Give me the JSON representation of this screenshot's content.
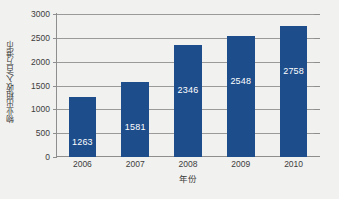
{
  "chart_data": {
    "type": "bar",
    "title": "",
    "subtitle": "",
    "categories": [
      "2006",
      "2007",
      "2008",
      "2009",
      "2010"
    ],
    "values": [
      1263,
      1581,
      2346,
      2548,
      2758
    ],
    "data_labels": [
      "1263",
      "1581",
      "2346",
      "2548",
      "2758"
    ],
    "xlabel": "年份",
    "ylabel": "物业出租收入/百万港币",
    "ylim": [
      0,
      3000
    ],
    "ytick_values": [
      0,
      500,
      1000,
      1500,
      2000,
      2500,
      3000
    ],
    "ytick_labels": [
      "0",
      "500",
      "1000",
      "1500",
      "2000",
      "2500",
      "3000"
    ],
    "grid": true,
    "grid_axis": "y",
    "legend": false,
    "legend_position": "none",
    "series": [
      {
        "name": "物业出租收入",
        "values": [
          1263,
          1581,
          2346,
          2548,
          2758
        ],
        "color": "#1e4d8b"
      }
    ],
    "colors": {
      "bar": "#1e4d8b",
      "background": "#f1f1ef",
      "gridline": "#9a9a9a",
      "axis": "#8e8e8e",
      "label_text": "#3d3d3d",
      "value_text": "#ffffff"
    }
  }
}
